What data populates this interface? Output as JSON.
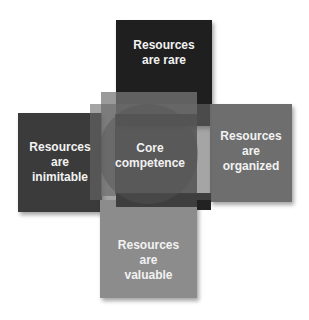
{
  "diagram": {
    "type": "overlapping-squares-venn",
    "center": {
      "label_line1": "Core",
      "label_line2": "competence"
    },
    "boxes": [
      {
        "id": "rare",
        "position": "top",
        "line1": "Resources",
        "line2": "are rare",
        "line3": "",
        "color": "#1f1f1f"
      },
      {
        "id": "inimitable",
        "position": "left",
        "line1": "Resources",
        "line2": "are",
        "line3": "inimitable",
        "color": "#3b3b3b"
      },
      {
        "id": "organized",
        "position": "right",
        "line1": "Resources",
        "line2": "are",
        "line3": "organized",
        "color": "#6e6e6e"
      },
      {
        "id": "valuable",
        "position": "bottom",
        "line1": "Resources",
        "line2": "are",
        "line3": "valuable",
        "color": "#8c8c8c"
      }
    ]
  }
}
